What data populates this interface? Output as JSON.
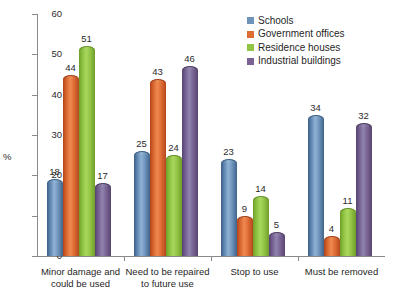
{
  "chart_data": {
    "type": "bar",
    "title": "",
    "xlabel": "",
    "ylabel": "%",
    "ylim": [
      0,
      60
    ],
    "yticks": [
      0,
      10,
      20,
      30,
      40,
      50,
      60
    ],
    "grid": false,
    "legend_position": "top-right",
    "categories": [
      "Minor damage and\ncould be used",
      "Need to be repaired\nto future use",
      "Stop to use",
      "Must be removed"
    ],
    "series": [
      {
        "name": "Schools",
        "color": "#6e93bb",
        "values": [
          18,
          25,
          23,
          34
        ]
      },
      {
        "name": "Government offices",
        "color": "#dd6c33",
        "values": [
          44,
          43,
          9,
          4
        ]
      },
      {
        "name": "Residence houses",
        "color": "#92c444",
        "values": [
          51,
          24,
          14,
          11
        ]
      },
      {
        "name": "Industrial buildings",
        "color": "#786394",
        "values": [
          17,
          46,
          5,
          32
        ]
      }
    ]
  }
}
